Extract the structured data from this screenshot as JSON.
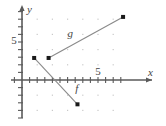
{
  "figure": {
    "background_color": "#ffffff",
    "axis_color": "#5a5a5a",
    "grid_dot_color": "#c9c9c9",
    "line_color": "#8a8a8a",
    "point_color": "#1a1a1a",
    "text_color": "#444444"
  },
  "axes": {
    "x_axis_label": "x",
    "y_axis_label": "y",
    "x_tick_label": "5",
    "y_tick_label": "5",
    "x_tick_value": 5,
    "y_tick_value": 5,
    "xlim": [
      -1,
      13
    ],
    "ylim": [
      -5,
      10
    ],
    "tick_interval": 1,
    "grid_dot_interval": 2,
    "x_axis_arrow": true,
    "y_axis_arrow": true
  },
  "chart_data": {
    "type": "line",
    "title": "",
    "xlabel": "x",
    "ylabel": "y",
    "xlim": [
      -1,
      13
    ],
    "ylim": [
      -5,
      10
    ],
    "grid": "dotted",
    "legend": "inline-labels",
    "series": [
      {
        "name": "g",
        "label": "g",
        "label_x": 6.0,
        "label_y": 5.6,
        "points": [
          {
            "x": 3.5,
            "y": 2.9
          },
          {
            "x": 13.3,
            "y": 8.3
          }
        ],
        "endpoints_marked": true
      },
      {
        "name": "f",
        "label": "f",
        "label_x": 7.0,
        "label_y": -1.6,
        "points": [
          {
            "x": 1.6,
            "y": 2.9
          },
          {
            "x": 7.3,
            "y": -3.2
          }
        ],
        "endpoints_marked": true
      }
    ]
  }
}
